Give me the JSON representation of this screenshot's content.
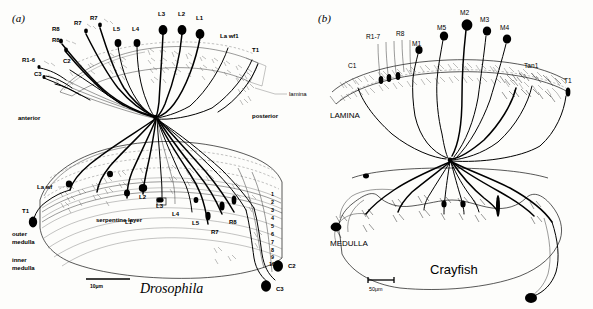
{
  "figure": {
    "type": "scientific-line-drawing",
    "background_color": "#fdfdfb",
    "ink_color": "#000000"
  },
  "panel_a": {
    "letter": "(a)",
    "species": "Drosophila",
    "orientation": {
      "left": "anterior",
      "right": "posterior"
    },
    "regions": {
      "lamina": "lamina",
      "serpentine": "serpentine layer",
      "outer_medulla": "outer\nmedulla",
      "outer_medulla_line1": "outer",
      "outer_medulla_line2": "medulla",
      "inner_medulla_line1": "inner",
      "inner_medulla_line2": "medulla"
    },
    "top_labels": [
      {
        "text": "R1-6",
        "x": 22,
        "y": 62
      },
      {
        "text": "C3",
        "x": 34,
        "y": 76
      },
      {
        "text": "C2",
        "x": 63,
        "y": 63
      },
      {
        "text": "R8",
        "x": 52,
        "y": 31
      },
      {
        "text": "R8",
        "x": 52,
        "y": 42
      },
      {
        "text": "R7",
        "x": 74,
        "y": 25
      },
      {
        "text": "R7",
        "x": 90,
        "y": 20
      },
      {
        "text": "L5",
        "x": 113,
        "y": 31
      },
      {
        "text": "L4",
        "x": 132,
        "y": 31
      },
      {
        "text": "L3",
        "x": 158,
        "y": 16
      },
      {
        "text": "L2",
        "x": 178,
        "y": 16
      },
      {
        "text": "L1",
        "x": 196,
        "y": 20
      },
      {
        "text": "La wf1",
        "x": 220,
        "y": 38
      },
      {
        "text": "T1",
        "x": 252,
        "y": 52
      }
    ],
    "medulla_labels": [
      {
        "text": "La wf",
        "x": 50,
        "y": 188
      },
      {
        "text": "L1",
        "x": 128,
        "y": 222
      },
      {
        "text": "L2",
        "x": 143,
        "y": 196
      },
      {
        "text": "L3",
        "x": 161,
        "y": 205
      },
      {
        "text": "L4",
        "x": 175,
        "y": 212
      },
      {
        "text": "L5",
        "x": 195,
        "y": 223
      },
      {
        "text": "R7",
        "x": 214,
        "y": 233
      },
      {
        "text": "R8",
        "x": 232,
        "y": 222
      },
      {
        "text": "T1",
        "x": 23,
        "y": 220
      }
    ],
    "bottom_labels": [
      {
        "text": "C2",
        "x": 288,
        "y": 266
      },
      {
        "text": "C3",
        "x": 276,
        "y": 289
      }
    ],
    "medulla_strata": [
      "1",
      "2",
      "3",
      "4",
      "5",
      "6",
      "7",
      "8",
      "9",
      "10"
    ],
    "scale_bar": {
      "label": "10μm",
      "length_px": 44
    },
    "leader_label": "lamina"
  },
  "panel_b": {
    "letter": "(b)",
    "species": "Crayfish",
    "regions": {
      "lamina": "LAMINA",
      "medulla": "MEDULLA"
    },
    "labels": [
      {
        "text": "R1-7",
        "x": 368,
        "y": 37
      },
      {
        "text": "R8",
        "x": 398,
        "y": 34
      },
      {
        "text": "M1",
        "x": 415,
        "y": 47
      },
      {
        "text": "M5",
        "x": 438,
        "y": 32
      },
      {
        "text": "M2",
        "x": 462,
        "y": 15
      },
      {
        "text": "M3",
        "x": 480,
        "y": 23
      },
      {
        "text": "M4",
        "x": 503,
        "y": 32
      },
      {
        "text": "C1",
        "x": 352,
        "y": 65
      },
      {
        "text": "Tan1",
        "x": 529,
        "y": 65
      },
      {
        "text": "T1",
        "x": 567,
        "y": 81
      }
    ],
    "scale_bar": {
      "label": "50μm",
      "length_px": 26
    }
  }
}
